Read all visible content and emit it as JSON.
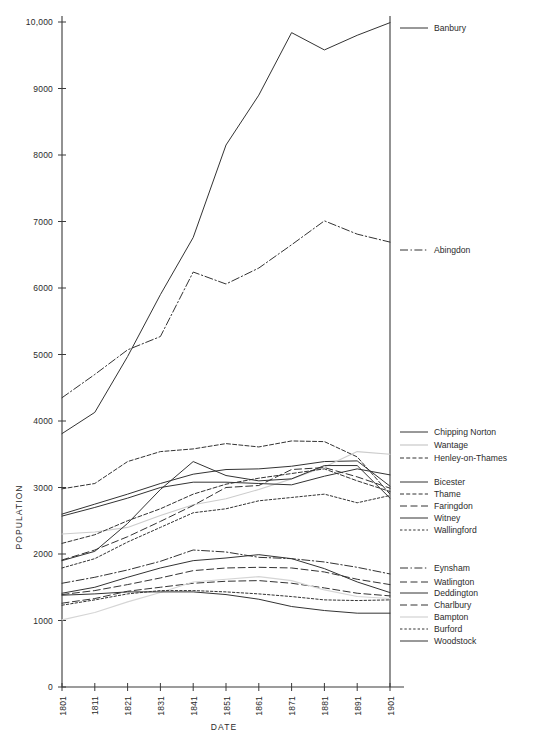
{
  "chart_data": {
    "type": "line",
    "title": "",
    "xlabel": "DATE",
    "ylabel": "POPULATION",
    "x": [
      1801,
      1811,
      1821,
      1831,
      1841,
      1851,
      1861,
      1871,
      1881,
      1891,
      1901
    ],
    "xtick_labels": [
      "1801",
      "1811",
      "1821",
      "1831",
      "1841",
      "1851",
      "1861",
      "1871",
      "1881",
      "1891",
      "1901"
    ],
    "ytick_labels": [
      "0",
      "1000",
      "2000",
      "3000",
      "4000",
      "5000",
      "6000",
      "7000",
      "8000",
      "9000",
      "10,000"
    ],
    "ytick_values": [
      0,
      1000,
      2000,
      3000,
      4000,
      5000,
      6000,
      7000,
      8000,
      9000,
      10000
    ],
    "xlim": [
      1801,
      1901
    ],
    "ylim": [
      0,
      10000
    ],
    "grid": false,
    "legend_position": "right",
    "series": [
      {
        "name": "Banbury",
        "style": "solid",
        "color": "#333333",
        "width": 1.0,
        "values": [
          3810,
          4130,
          4970,
          5900,
          6760,
          8150,
          8900,
          9840,
          9580,
          9800,
          9990
        ]
      },
      {
        "name": "Abingdon",
        "style": "dashdot",
        "color": "#333333",
        "width": 1.0,
        "values": [
          4350,
          4700,
          5070,
          5270,
          6240,
          6060,
          6300,
          6650,
          7010,
          6810,
          6690
        ]
      },
      {
        "name": "Chipping Norton",
        "style": "solid",
        "color": "#333333",
        "width": 1.0,
        "values": [
          2600,
          2750,
          2900,
          3060,
          3200,
          3270,
          3280,
          3320,
          3390,
          3400,
          3020
        ]
      },
      {
        "name": "Wantage",
        "style": "solid",
        "color": "#cccccc",
        "width": 1.1,
        "values": [
          2300,
          2330,
          2400,
          2580,
          2740,
          2830,
          2970,
          3130,
          3310,
          3540,
          3500
        ]
      },
      {
        "name": "Henley-on-Thames",
        "style": "dashed",
        "color": "#333333",
        "width": 1.0,
        "values": [
          2980,
          3060,
          3390,
          3540,
          3580,
          3660,
          3610,
          3700,
          3690,
          3460,
          2900
        ]
      },
      {
        "name": "Bicester",
        "style": "solid",
        "color": "#333333",
        "width": 1.0,
        "values": [
          1900,
          2040,
          2460,
          2970,
          3390,
          3180,
          3100,
          3130,
          3330,
          3330,
          2840
        ]
      },
      {
        "name": "Thame",
        "style": "dashed",
        "color": "#333333",
        "width": 1.0,
        "values": [
          2160,
          2290,
          2500,
          2680,
          2900,
          3050,
          3140,
          3210,
          3280,
          3100,
          2940
        ]
      },
      {
        "name": "Faringdon",
        "style": "dash-long",
        "color": "#333333",
        "width": 1.0,
        "values": [
          1910,
          2060,
          2260,
          2490,
          2730,
          3000,
          3030,
          3270,
          3300,
          3160,
          2990
        ]
      },
      {
        "name": "Witney",
        "style": "solid",
        "color": "#333333",
        "width": 1.0,
        "values": [
          2570,
          2700,
          2840,
          3000,
          3080,
          3080,
          3060,
          3040,
          3170,
          3280,
          3190
        ]
      },
      {
        "name": "Wallingford",
        "style": "dotted-dash",
        "color": "#333333",
        "width": 1.0,
        "values": [
          1790,
          1930,
          2180,
          2400,
          2620,
          2680,
          2800,
          2850,
          2900,
          2770,
          2880
        ]
      },
      {
        "name": "Eynsham",
        "style": "dashdot",
        "color": "#333333",
        "width": 1.0,
        "values": [
          1560,
          1650,
          1760,
          1890,
          2060,
          2030,
          1950,
          1930,
          1880,
          1800,
          1700
        ]
      },
      {
        "name": "Watlington",
        "style": "dash-long",
        "color": "#333333",
        "width": 1.0,
        "values": [
          1390,
          1450,
          1540,
          1640,
          1750,
          1790,
          1800,
          1790,
          1730,
          1620,
          1540
        ]
      },
      {
        "name": "Deddington",
        "style": "solid",
        "color": "#333333",
        "width": 1.0,
        "values": [
          1410,
          1500,
          1650,
          1790,
          1900,
          1940,
          1990,
          1930,
          1780,
          1580,
          1420
        ]
      },
      {
        "name": "Charlbury",
        "style": "dash-long",
        "color": "#333333",
        "width": 1.0,
        "values": [
          1260,
          1330,
          1440,
          1500,
          1560,
          1590,
          1600,
          1560,
          1490,
          1410,
          1370
        ]
      },
      {
        "name": "Bampton",
        "style": "solid",
        "color": "#d5d5d5",
        "width": 1.1,
        "values": [
          1010,
          1120,
          1280,
          1420,
          1580,
          1620,
          1660,
          1600,
          1460,
          1360,
          1330
        ]
      },
      {
        "name": "Burford",
        "style": "dotted-dash",
        "color": "#333333",
        "width": 1.0,
        "values": [
          1230,
          1310,
          1400,
          1450,
          1450,
          1430,
          1400,
          1360,
          1310,
          1300,
          1310
        ]
      },
      {
        "name": "Woodstock",
        "style": "solid",
        "color": "#333333",
        "width": 1.0,
        "values": [
          1380,
          1400,
          1430,
          1430,
          1430,
          1390,
          1320,
          1210,
          1150,
          1110,
          1110
        ]
      }
    ],
    "legend_groups": [
      {
        "id": "group-banbury",
        "entries": [
          "Banbury"
        ]
      },
      {
        "id": "group-abingdon",
        "entries": [
          "Abingdon"
        ]
      },
      {
        "id": "group-upper",
        "entries": [
          "Chipping Norton",
          "Wantage",
          "Henley-on-Thames"
        ]
      },
      {
        "id": "group-mid",
        "entries": [
          "Bicester",
          "Thame",
          "Faringdon",
          "Witney",
          "Wallingford"
        ]
      },
      {
        "id": "group-lower",
        "entries": [
          "Eynsham",
          "Watlington",
          "Deddington",
          "Charlbury",
          "Bampton",
          "Burford",
          "Woodstock"
        ]
      }
    ]
  },
  "legend": {
    "items": [
      {
        "label": "Banbury",
        "style": "solid",
        "color": "#333333",
        "y": 28
      },
      {
        "label": "Abingdon",
        "style": "dashdot",
        "color": "#333333",
        "y": 250
      },
      {
        "label": "Chipping Norton",
        "style": "solid",
        "color": "#333333",
        "y": 432
      },
      {
        "label": "Wantage",
        "style": "solid",
        "color": "#cccccc",
        "y": 445
      },
      {
        "label": "Henley-on-Thames",
        "style": "dashed",
        "color": "#333333",
        "y": 458
      },
      {
        "label": "Bicester",
        "style": "solid",
        "color": "#333333",
        "y": 482
      },
      {
        "label": "Thame",
        "style": "dashed",
        "color": "#333333",
        "y": 494
      },
      {
        "label": "Faringdon",
        "style": "dash-long",
        "color": "#333333",
        "y": 506
      },
      {
        "label": "Witney",
        "style": "solid",
        "color": "#333333",
        "y": 518
      },
      {
        "label": "Wallingford",
        "style": "dotted-dash",
        "color": "#333333",
        "y": 530
      },
      {
        "label": "Eynsham",
        "style": "dashdot",
        "color": "#333333",
        "y": 568
      },
      {
        "label": "Watlington",
        "style": "dash-long",
        "color": "#333333",
        "y": 582
      },
      {
        "label": "Deddington",
        "style": "solid",
        "color": "#333333",
        "y": 593
      },
      {
        "label": "Charlbury",
        "style": "dash-long",
        "color": "#333333",
        "y": 605
      },
      {
        "label": "Bampton",
        "style": "solid",
        "color": "#d5d5d5",
        "y": 617
      },
      {
        "label": "Burford",
        "style": "dotted-dash",
        "color": "#333333",
        "y": 629
      },
      {
        "label": "Woodstock",
        "style": "solid",
        "color": "#333333",
        "y": 641
      }
    ]
  }
}
